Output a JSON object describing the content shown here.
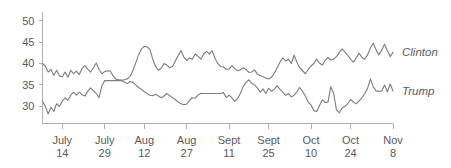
{
  "chart_data": {
    "type": "line",
    "title": "",
    "subtitle": "",
    "xlabel": "",
    "ylabel": "",
    "ylim": [
      26,
      52
    ],
    "yticks": [
      30,
      35,
      40,
      45,
      50
    ],
    "ytick_labels": [
      "30",
      "35",
      "40",
      "45",
      "50"
    ],
    "grid": false,
    "legend_position": "right-inline",
    "xtick_labels": [
      {
        "month": "July",
        "day": "14"
      },
      {
        "month": "July",
        "day": "29"
      },
      {
        "month": "Aug",
        "day": "12"
      },
      {
        "month": "Aug",
        "day": "27"
      },
      {
        "month": "Sept",
        "day": "11"
      },
      {
        "month": "Sept",
        "day": "25"
      },
      {
        "month": "Oct",
        "day": "10"
      },
      {
        "month": "Oct",
        "day": "24"
      },
      {
        "month": "Nov",
        "day": "8"
      }
    ],
    "xtick_indices": [
      7,
      22,
      36,
      51,
      66,
      80,
      95,
      109,
      124
    ],
    "x_index_range": [
      0,
      124
    ],
    "line_color": "#808080",
    "axis_color": "#b0b0b0",
    "text_color": "#58595b",
    "series": [
      {
        "name": "Clinton",
        "label": "Clinton",
        "values": [
          40.0,
          39.4,
          38.0,
          38.6,
          37.2,
          38.4,
          37.1,
          36.9,
          38.0,
          36.8,
          38.4,
          37.6,
          38.2,
          37.4,
          38.8,
          39.5,
          38.7,
          38.0,
          39.0,
          40.1,
          38.6,
          37.6,
          38.1,
          38.3,
          38.2,
          37.1,
          36.3,
          36.2,
          36.1,
          36.2,
          36.4,
          37.0,
          38.4,
          40.2,
          42.0,
          43.4,
          44.0,
          43.9,
          43.3,
          41.0,
          39.3,
          38.4,
          38.9,
          40.0,
          39.6,
          39.0,
          39.3,
          40.6,
          41.8,
          43.0,
          41.5,
          40.7,
          41.3,
          41.0,
          42.2,
          41.7,
          41.0,
          42.2,
          42.8,
          42.2,
          43.0,
          41.2,
          40.0,
          39.3,
          39.2,
          38.6,
          38.7,
          39.5,
          38.8,
          38.3,
          38.5,
          39.0,
          38.6,
          37.9,
          38.0,
          38.5,
          37.5,
          37.2,
          36.9,
          36.6,
          36.4,
          36.8,
          37.7,
          39.0,
          40.3,
          41.3,
          40.6,
          41.0,
          40.0,
          41.9,
          40.3,
          39.0,
          38.3,
          37.6,
          38.6,
          39.4,
          40.0,
          41.0,
          40.1,
          39.6,
          40.7,
          41.4,
          40.8,
          41.0,
          41.6,
          42.6,
          43.4,
          42.7,
          41.9,
          41.0,
          40.3,
          41.3,
          42.4,
          41.4,
          41.0,
          42.0,
          43.6,
          44.7,
          43.2,
          42.0,
          43.1,
          44.5,
          43.0,
          41.6,
          42.6
        ]
      },
      {
        "name": "Trump",
        "label": "Trump",
        "values": [
          31.2,
          30.0,
          28.2,
          29.8,
          28.8,
          30.6,
          30.0,
          31.2,
          32.0,
          31.4,
          32.6,
          33.3,
          32.6,
          33.3,
          32.7,
          32.4,
          33.5,
          34.3,
          33.6,
          33.0,
          32.0,
          34.8,
          36.0,
          36.0,
          36.0,
          36.0,
          36.0,
          36.0,
          36.0,
          35.7,
          35.3,
          35.8,
          35.6,
          35.0,
          34.4,
          34.0,
          33.4,
          33.0,
          32.6,
          32.5,
          32.8,
          32.4,
          32.0,
          32.4,
          33.0,
          32.5,
          32.0,
          31.6,
          31.0,
          30.6,
          30.4,
          30.5,
          31.4,
          32.0,
          31.9,
          32.6,
          33.0,
          33.0,
          33.0,
          33.0,
          33.0,
          33.0,
          33.0,
          33.0,
          33.2,
          32.1,
          32.6,
          32.0,
          31.2,
          31.8,
          33.0,
          34.6,
          35.6,
          36.2,
          35.4,
          35.0,
          34.3,
          33.3,
          34.1,
          33.0,
          34.2,
          33.5,
          34.0,
          34.8,
          34.0,
          33.3,
          32.6,
          33.0,
          32.2,
          32.6,
          33.4,
          34.4,
          33.5,
          32.4,
          31.0,
          30.3,
          29.0,
          28.8,
          30.2,
          31.5,
          30.9,
          31.0,
          34.6,
          33.0,
          29.2,
          28.5,
          29.6,
          30.0,
          30.6,
          31.6,
          31.0,
          30.6,
          31.3,
          32.0,
          33.0,
          34.2,
          36.4,
          34.6,
          33.6,
          33.5,
          33.6,
          35.0,
          33.4,
          35.2,
          33.6
        ]
      }
    ]
  }
}
